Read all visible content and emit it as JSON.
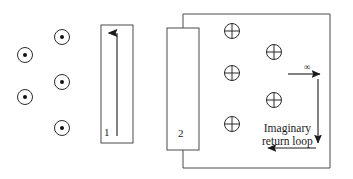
{
  "figure": {
    "background_color": "#ffffff",
    "stroke_color": "#2b2b2b",
    "line_color": "#4a4a4a",
    "text_color": "#1a1a1a",
    "width": 353,
    "height": 179
  },
  "conductors": [
    {
      "id": "1",
      "label": "1",
      "label_x": 104,
      "label_y": 126,
      "x": 101,
      "y": 25,
      "w": 32,
      "h": 118,
      "current_direction": "up",
      "arrow_x": 117,
      "arrow_y_tail": 136,
      "arrow_y_head": 33
    },
    {
      "id": "2",
      "label": "2",
      "label_x": 178,
      "label_y": 127,
      "x": 167,
      "y": 28,
      "w": 32,
      "h": 122,
      "current_direction": "out-of-page-into-circuit",
      "arrow_x": null,
      "arrow_y_tail": null,
      "arrow_y_head": null
    }
  ],
  "field_markers": {
    "dot_symbol_name": "current-out-of-page",
    "cross_symbol_name": "current-into-page",
    "dots": [
      {
        "cx": 25,
        "cy": 55,
        "r": 7.5,
        "dot_r": 2.0
      },
      {
        "cx": 62,
        "cy": 37,
        "r": 7.5,
        "dot_r": 2.0
      },
      {
        "cx": 62,
        "cy": 82,
        "r": 7.5,
        "dot_r": 2.0
      },
      {
        "cx": 25,
        "cy": 97,
        "r": 7.5,
        "dot_r": 2.0
      },
      {
        "cx": 62,
        "cy": 128,
        "r": 7.5,
        "dot_r": 2.0
      }
    ],
    "crosses": [
      {
        "cx": 232,
        "cy": 31,
        "r": 7.5
      },
      {
        "cx": 274,
        "cy": 52,
        "r": 7.5
      },
      {
        "cx": 232,
        "cy": 73,
        "r": 7.5
      },
      {
        "cx": 274,
        "cy": 100,
        "r": 7.5
      },
      {
        "cx": 232,
        "cy": 124,
        "r": 7.5
      }
    ]
  },
  "circuit_loop": {
    "name": "outer-circuit-loop",
    "top_y": 14,
    "bottom_y": 168,
    "right_x": 330,
    "left_stub_x": 183,
    "top_stub_from_y": 14,
    "top_stub_to_y": 28,
    "bottom_stub_from_y": 150,
    "bottom_stub_to_y": 168
  },
  "return_loop": {
    "caption_line1": "Imaginary",
    "caption_line2": "return loop",
    "caption_x": 262,
    "caption_y": 122,
    "infinity_symbol": "∞",
    "infinity_x": 304,
    "infinity_y": 62,
    "top_arrow": {
      "x1": 288,
      "y1": 74,
      "x2": 320,
      "y2": 74,
      "direction": "right"
    },
    "vertical_arrow": {
      "x1": 318,
      "y1": 79,
      "x2": 318,
      "y2": 143,
      "direction": "down"
    },
    "bottom_arrow": {
      "x1": 316,
      "y1": 148,
      "x2": 268,
      "y2": 148,
      "direction": "left"
    }
  }
}
